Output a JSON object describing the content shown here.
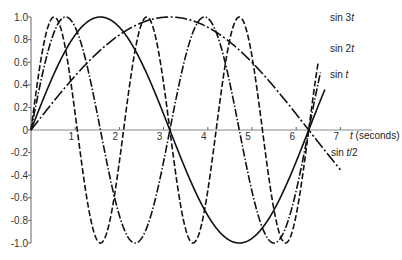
{
  "chart_data": {
    "type": "line",
    "title": "",
    "xlabel": "t (seconds)",
    "ylabel": "",
    "xlim": [
      0,
      7
    ],
    "ylim": [
      -1.0,
      1.0
    ],
    "grid": false,
    "legend": "inline labels at right end of curves",
    "x_ticks": [
      "1",
      "2",
      "3",
      "4",
      "5",
      "6",
      "7"
    ],
    "y_ticks": [
      "1.0",
      "0.8",
      "0.6",
      "0.4",
      "0.2",
      "0",
      "-0.2",
      "-0.4",
      "-0.6",
      "-0.8",
      "-1.0"
    ],
    "x_domain": [
      0,
      6.5
    ],
    "series": [
      {
        "name": "sin 3t",
        "function": "sin(3t)",
        "style": "short-dash",
        "t_max": 6.5,
        "label_pos": "end"
      },
      {
        "name": "sin 2t",
        "function": "sin(2t)",
        "style": "dash-dot",
        "t_max": 6.55,
        "label_pos": "end"
      },
      {
        "name": "sin t",
        "function": "sin(t)",
        "style": "solid",
        "t_max": 6.65,
        "label_pos": "end"
      },
      {
        "name": "sin t/2",
        "function": "sin(t/2)",
        "style": "long-dash-dot",
        "t_max": 7.0,
        "label_pos": "end"
      }
    ],
    "annotations": [
      "sin 3t",
      "sin 2t",
      "sin t",
      "sin t/2"
    ]
  },
  "labels": {
    "x_axis": "t (seconds)",
    "sin3t": "sin 3",
    "sin2t": "sin 2",
    "sint": "sin ",
    "sinhalf_a": "sin ",
    "sinhalf_b": "/2",
    "t": "t",
    "t_axis_t": "t",
    "t_axis_unit": " (seconds)"
  }
}
